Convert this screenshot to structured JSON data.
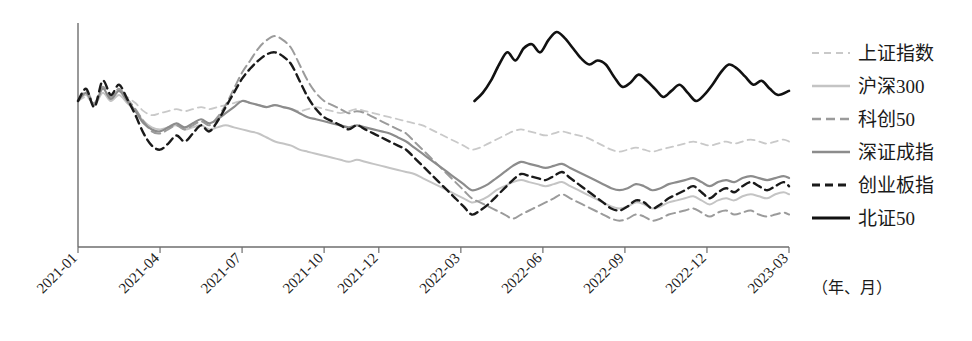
{
  "chart_data": {
    "type": "line",
    "title": "",
    "subtitle": "",
    "xlabel": "（年、月）",
    "ylabel": "",
    "grid": false,
    "legend_position": "right",
    "axis": {
      "x_axis_visible": true,
      "y_axis_visible": true,
      "y_tick_labels_visible": false,
      "x_tick_label_rotation": -45
    },
    "xlim": [
      "2021-01",
      "2023-03"
    ],
    "ylim": [
      0,
      100
    ],
    "x_tick_labels": [
      "2021-01",
      "2021-04",
      "2021-07",
      "2021-10",
      "2021-12",
      "2022-03",
      "2022-06",
      "2022-09",
      "2022-12",
      "2023-03"
    ],
    "x_tick_positions": [
      0,
      3,
      6,
      9,
      11,
      14,
      17,
      20,
      23,
      26
    ],
    "note": "Index values are normalized (2021-01 = 100). Series are monthly/weekly closes read from pixel positions.",
    "series": [
      {
        "name": "上证指数",
        "style": "dashed",
        "color": "#c9c9c9",
        "width": 1.8,
        "dash": "7,5",
        "x": [
          0,
          0.3,
          0.6,
          0.9,
          1.2,
          1.5,
          1.8,
          2.1,
          2.4,
          2.7,
          3,
          3.3,
          3.6,
          3.9,
          4.2,
          4.5,
          4.8,
          5.1,
          5.4,
          5.7,
          6,
          6.3,
          6.6,
          6.9,
          7.2,
          7.5,
          7.8,
          8.1,
          8.4,
          8.7,
          9,
          9.3,
          9.6,
          9.9,
          10.2,
          10.5,
          10.8,
          11.1,
          11.4,
          11.7,
          12,
          12.3,
          12.6,
          12.9,
          13.2,
          13.5,
          13.8,
          14.1,
          14.4,
          14.7,
          15,
          15.3,
          15.6,
          15.9,
          16.2,
          16.5,
          16.8,
          17.1,
          17.4,
          17.7,
          18,
          18.3,
          18.6,
          18.9,
          19.2,
          19.5,
          19.8,
          20.1,
          20.4,
          20.7,
          21,
          21.3,
          21.6,
          21.9,
          22.2,
          22.5,
          22.8,
          23.1,
          23.4,
          23.7,
          24,
          24.3,
          24.6,
          24.9,
          25.2,
          25.5,
          25.8,
          26
        ],
        "y": [
          100,
          102,
          99,
          104,
          101,
          105,
          102,
          99,
          95,
          93,
          94,
          95,
          96,
          95,
          96,
          97,
          96,
          97,
          98,
          99,
          100,
          99,
          98,
          97,
          98,
          97,
          96,
          95,
          96,
          97,
          96,
          95,
          94,
          95,
          96,
          95,
          94,
          93,
          92,
          91,
          90,
          89,
          88,
          86,
          84,
          82,
          80,
          78,
          76,
          77,
          79,
          81,
          83,
          85,
          86,
          85,
          84,
          83,
          84,
          85,
          84,
          83,
          82,
          80,
          78,
          76,
          75,
          76,
          77,
          76,
          75,
          76,
          77,
          78,
          79,
          80,
          79,
          78,
          79,
          80,
          79,
          80,
          81,
          80,
          79,
          80,
          81,
          80
        ]
      },
      {
        "name": "沪深300",
        "style": "solid",
        "color": "#c4c4c4",
        "width": 2.0,
        "dash": "",
        "x": [
          0,
          0.3,
          0.6,
          0.9,
          1.2,
          1.5,
          1.8,
          2.1,
          2.4,
          2.7,
          3,
          3.3,
          3.6,
          3.9,
          4.2,
          4.5,
          4.8,
          5.1,
          5.4,
          5.7,
          6,
          6.3,
          6.6,
          6.9,
          7.2,
          7.5,
          7.8,
          8.1,
          8.4,
          8.7,
          9,
          9.3,
          9.6,
          9.9,
          10.2,
          10.5,
          10.8,
          11.1,
          11.4,
          11.7,
          12,
          12.3,
          12.6,
          12.9,
          13.2,
          13.5,
          13.8,
          14.1,
          14.4,
          14.7,
          15,
          15.3,
          15.6,
          15.9,
          16.2,
          16.5,
          16.8,
          17.1,
          17.4,
          17.7,
          18,
          18.3,
          18.6,
          18.9,
          19.2,
          19.5,
          19.8,
          20.1,
          20.4,
          20.7,
          21,
          21.3,
          21.6,
          21.9,
          22.2,
          22.5,
          22.8,
          23.1,
          23.4,
          23.7,
          24,
          24.3,
          24.6,
          24.9,
          25.2,
          25.5,
          25.8,
          26
        ],
        "y": [
          100,
          103,
          98,
          104,
          100,
          103,
          99,
          95,
          90,
          87,
          86,
          87,
          88,
          86,
          87,
          88,
          86,
          87,
          88,
          87,
          86,
          85,
          84,
          82,
          80,
          79,
          78,
          76,
          75,
          74,
          73,
          72,
          71,
          70,
          71,
          70,
          69,
          68,
          67,
          66,
          65,
          64,
          62,
          60,
          58,
          56,
          54,
          52,
          50,
          51,
          53,
          56,
          58,
          60,
          61,
          60,
          59,
          58,
          59,
          60,
          58,
          56,
          54,
          52,
          50,
          48,
          47,
          48,
          50,
          49,
          47,
          48,
          50,
          51,
          52,
          53,
          51,
          49,
          51,
          52,
          51,
          53,
          54,
          53,
          52,
          54,
          55,
          54
        ]
      },
      {
        "name": "科创50",
        "style": "dashed",
        "color": "#9b9b9b",
        "width": 2.0,
        "dash": "9,5",
        "x": [
          0,
          0.3,
          0.6,
          0.9,
          1.2,
          1.5,
          1.8,
          2.1,
          2.4,
          2.7,
          3,
          3.3,
          3.6,
          3.9,
          4.2,
          4.5,
          4.8,
          5.1,
          5.4,
          5.7,
          6,
          6.3,
          6.6,
          6.9,
          7.2,
          7.5,
          7.8,
          8.1,
          8.4,
          8.7,
          9,
          9.3,
          9.6,
          9.9,
          10.2,
          10.5,
          10.8,
          11.1,
          11.4,
          11.7,
          12,
          12.3,
          12.6,
          12.9,
          13.2,
          13.5,
          13.8,
          14.1,
          14.4,
          14.7,
          15,
          15.3,
          15.6,
          15.9,
          16.2,
          16.5,
          16.8,
          17.1,
          17.4,
          17.7,
          18,
          18.3,
          18.6,
          18.9,
          19.2,
          19.5,
          19.8,
          20.1,
          20.4,
          20.7,
          21,
          21.3,
          21.6,
          21.9,
          22.2,
          22.5,
          22.8,
          23.1,
          23.4,
          23.7,
          24,
          24.3,
          24.6,
          24.9,
          25.2,
          25.5,
          25.8,
          26
        ],
        "y": [
          100,
          105,
          99,
          107,
          102,
          106,
          101,
          96,
          90,
          85,
          84,
          86,
          88,
          86,
          88,
          90,
          88,
          92,
          98,
          106,
          114,
          120,
          126,
          130,
          132,
          130,
          126,
          118,
          110,
          104,
          100,
          98,
          96,
          94,
          95,
          94,
          92,
          90,
          88,
          86,
          84,
          80,
          76,
          72,
          68,
          64,
          60,
          56,
          52,
          50,
          48,
          46,
          44,
          42,
          44,
          46,
          48,
          50,
          52,
          54,
          52,
          50,
          48,
          46,
          44,
          42,
          41,
          42,
          44,
          43,
          41,
          42,
          44,
          45,
          46,
          47,
          45,
          43,
          45,
          46,
          44,
          45,
          46,
          44,
          43,
          44,
          45,
          44
        ]
      },
      {
        "name": "深证成指",
        "style": "solid",
        "color": "#8c8c8c",
        "width": 2.2,
        "dash": "",
        "x": [
          0,
          0.3,
          0.6,
          0.9,
          1.2,
          1.5,
          1.8,
          2.1,
          2.4,
          2.7,
          3,
          3.3,
          3.6,
          3.9,
          4.2,
          4.5,
          4.8,
          5.1,
          5.4,
          5.7,
          6,
          6.3,
          6.6,
          6.9,
          7.2,
          7.5,
          7.8,
          8.1,
          8.4,
          8.7,
          9,
          9.3,
          9.6,
          9.9,
          10.2,
          10.5,
          10.8,
          11.1,
          11.4,
          11.7,
          12,
          12.3,
          12.6,
          12.9,
          13.2,
          13.5,
          13.8,
          14.1,
          14.4,
          14.7,
          15,
          15.3,
          15.6,
          15.9,
          16.2,
          16.5,
          16.8,
          17.1,
          17.4,
          17.7,
          18,
          18.3,
          18.6,
          18.9,
          19.2,
          19.5,
          19.8,
          20.1,
          20.4,
          20.7,
          21,
          21.3,
          21.6,
          21.9,
          22.2,
          22.5,
          22.8,
          23.1,
          23.4,
          23.7,
          24,
          24.3,
          24.6,
          24.9,
          25.2,
          25.5,
          25.8,
          26
        ],
        "y": [
          100,
          104,
          98,
          106,
          101,
          105,
          100,
          95,
          89,
          86,
          85,
          87,
          89,
          87,
          89,
          91,
          89,
          91,
          94,
          97,
          100,
          99,
          98,
          97,
          98,
          97,
          96,
          94,
          92,
          91,
          90,
          89,
          88,
          87,
          88,
          87,
          86,
          85,
          84,
          82,
          80,
          77,
          74,
          71,
          68,
          65,
          62,
          59,
          56,
          57,
          59,
          62,
          65,
          68,
          70,
          69,
          68,
          67,
          68,
          69,
          67,
          65,
          63,
          61,
          59,
          57,
          56,
          57,
          59,
          58,
          56,
          57,
          59,
          60,
          61,
          62,
          60,
          58,
          60,
          61,
          60,
          62,
          63,
          62,
          61,
          62,
          63,
          62
        ]
      },
      {
        "name": "创业板指",
        "style": "dashed",
        "color": "#1a1a1a",
        "width": 2.4,
        "dash": "8,5",
        "x": [
          0,
          0.3,
          0.6,
          0.9,
          1.2,
          1.5,
          1.8,
          2.1,
          2.4,
          2.7,
          3,
          3.3,
          3.6,
          3.9,
          4.2,
          4.5,
          4.8,
          5.1,
          5.4,
          5.7,
          6,
          6.3,
          6.6,
          6.9,
          7.2,
          7.5,
          7.8,
          8.1,
          8.4,
          8.7,
          9,
          9.3,
          9.6,
          9.9,
          10.2,
          10.5,
          10.8,
          11.1,
          11.4,
          11.7,
          12,
          12.3,
          12.6,
          12.9,
          13.2,
          13.5,
          13.8,
          14.1,
          14.4,
          14.7,
          15,
          15.3,
          15.6,
          15.9,
          16.2,
          16.5,
          16.8,
          17.1,
          17.4,
          17.7,
          18,
          18.3,
          18.6,
          18.9,
          19.2,
          19.5,
          19.8,
          20.1,
          20.4,
          20.7,
          21,
          21.3,
          21.6,
          21.9,
          22.2,
          22.5,
          22.8,
          23.1,
          23.4,
          23.7,
          24,
          24.3,
          24.6,
          24.9,
          25.2,
          25.5,
          25.8,
          26
        ],
        "y": [
          100,
          106,
          97,
          110,
          103,
          108,
          101,
          93,
          84,
          78,
          76,
          79,
          83,
          80,
          84,
          88,
          85,
          90,
          97,
          104,
          111,
          116,
          120,
          123,
          124,
          122,
          118,
          110,
          102,
          96,
          92,
          90,
          88,
          86,
          88,
          86,
          84,
          82,
          80,
          78,
          76,
          72,
          68,
          64,
          60,
          56,
          52,
          48,
          44,
          46,
          49,
          53,
          57,
          61,
          64,
          63,
          62,
          61,
          63,
          65,
          62,
          59,
          56,
          53,
          50,
          47,
          46,
          48,
          51,
          50,
          47,
          49,
          52,
          54,
          56,
          58,
          55,
          52,
          55,
          57,
          55,
          58,
          60,
          58,
          56,
          58,
          60,
          58
        ]
      },
      {
        "name": "北证50",
        "style": "solid",
        "color": "#111111",
        "width": 2.6,
        "dash": "",
        "x": [
          14.5,
          14.8,
          15.1,
          15.4,
          15.7,
          16,
          16.3,
          16.6,
          16.9,
          17.2,
          17.5,
          17.8,
          18.1,
          18.4,
          18.7,
          19,
          19.3,
          19.6,
          19.9,
          20.2,
          20.5,
          20.8,
          21.1,
          21.4,
          21.7,
          22,
          22.3,
          22.6,
          22.9,
          23.2,
          23.5,
          23.8,
          24.1,
          24.4,
          24.7,
          25,
          25.3,
          25.6,
          26
        ],
        "y": [
          100,
          104,
          110,
          118,
          124,
          120,
          126,
          128,
          124,
          130,
          134,
          131,
          126,
          121,
          118,
          120,
          118,
          112,
          107,
          109,
          113,
          110,
          106,
          102,
          105,
          108,
          104,
          100,
          103,
          108,
          114,
          118,
          116,
          112,
          108,
          110,
          106,
          103,
          105
        ]
      }
    ]
  },
  "legend": {
    "items": [
      {
        "label": "上证指数"
      },
      {
        "label": "沪深300"
      },
      {
        "label": "科创50"
      },
      {
        "label": "深证成指"
      },
      {
        "label": "创业板指"
      },
      {
        "label": "北证50"
      }
    ]
  },
  "axis_unit_note": "（年、月）"
}
